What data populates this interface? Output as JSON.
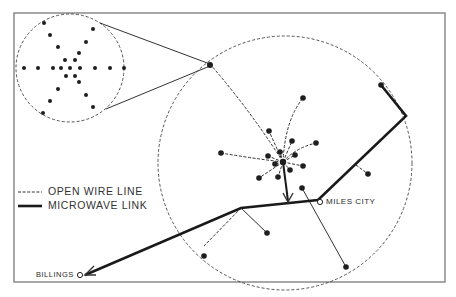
{
  "diagram": {
    "frame": {
      "x": 14,
      "y": 13,
      "w": 431,
      "h": 269
    },
    "inset_circle": {
      "cx": 70,
      "cy": 68,
      "r": 54
    },
    "region_circle": {
      "cx": 285,
      "cy": 163,
      "r": 127
    },
    "hub": {
      "x": 283,
      "y": 162
    },
    "cities": [
      {
        "name": "MILES CITY",
        "x": 319,
        "y": 201
      },
      {
        "name": "BILLINGS",
        "x": 80,
        "y": 275
      }
    ],
    "colors": {
      "line": "#1a1a1a",
      "frame": "#8a8a8a",
      "background": "#ffffff"
    }
  },
  "legend": {
    "open_wire_label": "OPEN WIRE LINE",
    "microwave_label": "MICROWAVE LINK"
  },
  "labels": {
    "miles_city": "MILES CITY",
    "billings": "BILLINGS"
  }
}
